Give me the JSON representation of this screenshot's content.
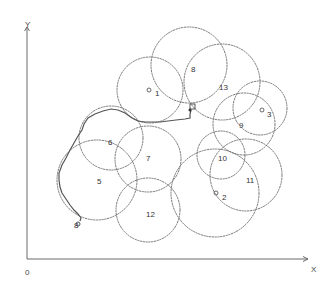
{
  "diagram": {
    "axes": {
      "x_label": "X",
      "y_label": "Y",
      "origin_label": "0",
      "origin": {
        "x": 27,
        "y": 259
      },
      "x_end": 308,
      "y_end": 27
    },
    "circles": [
      {
        "id": "1",
        "label": "1",
        "cx": 150,
        "cy": 90,
        "r": 33,
        "label_x": 155,
        "label_y": 96,
        "has_marker": true,
        "marker_x": 149,
        "marker_y": 90
      },
      {
        "id": "2",
        "label": "2",
        "cx": 215,
        "cy": 193,
        "r": 44,
        "label_x": 222,
        "label_y": 200,
        "has_marker": true,
        "marker_x": 216,
        "marker_y": 193
      },
      {
        "id": "3",
        "label": "3",
        "cx": 260,
        "cy": 108,
        "r": 27,
        "label_x": 267,
        "label_y": 117,
        "has_marker": true,
        "marker_x": 262,
        "marker_y": 110
      },
      {
        "id": "5",
        "label": "5",
        "cx": 97,
        "cy": 180,
        "r": 40,
        "label_x": 97,
        "label_y": 184,
        "has_marker": false
      },
      {
        "id": "6",
        "label": "6",
        "cx": 111,
        "cy": 138,
        "r": 32,
        "label_x": 108,
        "label_y": 145,
        "has_marker": false
      },
      {
        "id": "7",
        "label": "7",
        "cx": 148,
        "cy": 159,
        "r": 33,
        "label_x": 146,
        "label_y": 161,
        "has_marker": false
      },
      {
        "id": "8",
        "label": "8",
        "cx": 189,
        "cy": 65,
        "r": 38,
        "label_x": 191,
        "label_y": 72,
        "has_marker": false
      },
      {
        "id": "9",
        "label": "9",
        "cx": 244,
        "cy": 124,
        "r": 31,
        "label_x": 239,
        "label_y": 128,
        "has_marker": false
      },
      {
        "id": "10",
        "label": "10",
        "cx": 221,
        "cy": 155,
        "r": 24,
        "label_x": 218,
        "label_y": 161,
        "has_marker": false
      },
      {
        "id": "11",
        "label": "11",
        "cx": 246,
        "cy": 175,
        "r": 36,
        "label_x": 246,
        "label_y": 183,
        "has_marker": false
      },
      {
        "id": "12",
        "label": "12",
        "cx": 148,
        "cy": 210,
        "r": 32,
        "label_x": 146,
        "label_y": 217,
        "has_marker": false
      },
      {
        "id": "13",
        "label": "13",
        "cx": 222,
        "cy": 82,
        "r": 38,
        "label_x": 219,
        "label_y": 90,
        "has_marker": false
      }
    ],
    "start_marker": {
      "label": "8",
      "x": 78,
      "y": 224,
      "label_x": 74,
      "label_y": 228
    },
    "goal_marker": {
      "x": 191,
      "y": 109
    },
    "trajectory_points": "80,221 81,218 78,214 74,210 70,205 66,199 62,193 60,187 59,180 59,173 62,165 66,158 70,150 74,143 78,136 82,130 84,124 88,118 95,114 103,111 111,109 118,110 125,113 132,118 138,121 145,122 152,122 160,122 168,121 176,120 185,119 190,118 190,114 191,110"
  }
}
